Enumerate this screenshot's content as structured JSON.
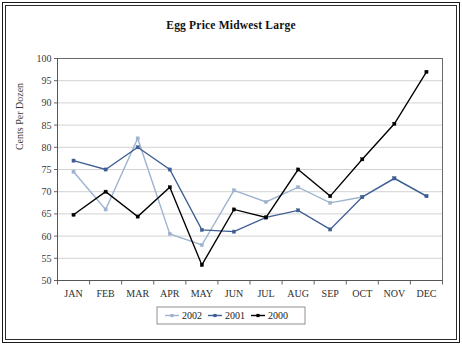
{
  "chart_data": {
    "type": "line",
    "title": "Egg Price Midwest Large",
    "xlabel": "",
    "ylabel": "Cents Per Dozen",
    "categories": [
      "JAN",
      "FEB",
      "MAR",
      "APR",
      "MAY",
      "JUN",
      "JUL",
      "AUG",
      "SEP",
      "OCT",
      "NOV",
      "DEC"
    ],
    "ylim": [
      50,
      100
    ],
    "yticks": [
      50,
      55,
      60,
      65,
      70,
      75,
      80,
      85,
      90,
      95,
      100
    ],
    "grid": true,
    "legend_position": "bottom-center",
    "series": [
      {
        "name": "2002",
        "color": "#9DB2CE",
        "values": [
          74.5,
          66.0,
          82.0,
          60.5,
          58.0,
          70.3,
          67.7,
          71.0,
          67.5,
          68.8,
          73.0,
          69.0
        ]
      },
      {
        "name": "2001",
        "color": "#3F5E92",
        "values": [
          77.0,
          75.0,
          80.0,
          75.0,
          61.4,
          61.0,
          64.2,
          65.8,
          61.5,
          68.8,
          73.0,
          69.0
        ]
      },
      {
        "name": "2000",
        "color": "#000000",
        "values": [
          64.8,
          70.0,
          64.4,
          71.0,
          53.5,
          66.0,
          64.2,
          75.0,
          69.0,
          77.3,
          85.3,
          97.0
        ]
      }
    ]
  },
  "legend": {
    "items": [
      {
        "label": "2002",
        "color": "#9DB2CE"
      },
      {
        "label": "2001",
        "color": "#3F5E92"
      },
      {
        "label": "2000",
        "color": "#000000"
      }
    ]
  },
  "frame": {
    "border_color": "#1a1a1a",
    "background": "#ffffff"
  }
}
